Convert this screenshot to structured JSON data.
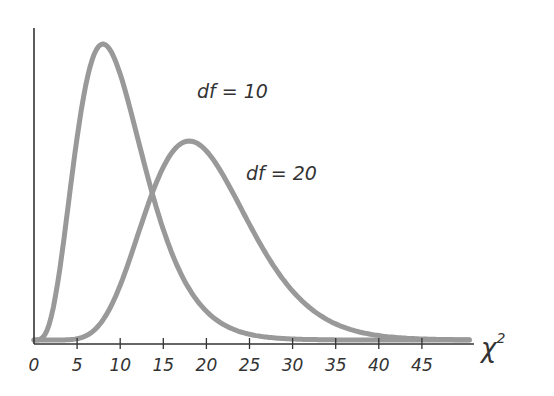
{
  "chart_data": {
    "type": "line",
    "title": "",
    "xlabel": "χ²",
    "ylabel": "",
    "xlim": [
      0,
      50
    ],
    "x_ticks": [
      0,
      5,
      10,
      15,
      20,
      25,
      30,
      35,
      40,
      45
    ],
    "x_tick_labels": [
      "0",
      "5",
      "10",
      "15",
      "20",
      "25",
      "30",
      "35",
      "40",
      "45"
    ],
    "grid": false,
    "legend": "inline annotations",
    "series": [
      {
        "name": "df = 10",
        "df": 10,
        "color": "#999999",
        "peak_x": 8,
        "label_pos": [
          200,
          92
        ]
      },
      {
        "name": "df = 20",
        "df": 20,
        "color": "#999999",
        "peak_x": 18,
        "label_pos": [
          248,
          177
        ]
      }
    ]
  },
  "labels": {
    "df10": "df = 10",
    "df20": "df = 20",
    "xaxis": "χ",
    "xaxis_sup": "2"
  },
  "style": {
    "curve_color": "#999999",
    "axis_color": "#333333"
  }
}
